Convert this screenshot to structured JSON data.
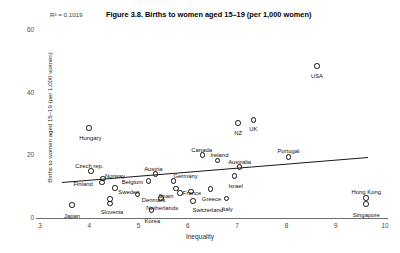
{
  "figure": {
    "r2_label": "R² = 0.1019",
    "title": "Figure 3.8. Births to women aged 15–19 (per 1,000 women)",
    "background_color": "#ffffff",
    "marker_color": "#111111",
    "trend_color": "#1a1a1a",
    "axis_color": "#6e6e6e"
  },
  "chart_data": {
    "type": "scatter",
    "title": "Figure 3.8. Births to women aged 15–19 (per 1,000 women)",
    "annotations": [
      "R² = 0.1019"
    ],
    "xlabel": "Inequality",
    "ylabel": "Births to women aged 15–19 (per 1,000 women)",
    "xlim": [
      3,
      10
    ],
    "ylim": [
      0,
      60
    ],
    "xticks": [
      3,
      4,
      5,
      6,
      7,
      8,
      9,
      10
    ],
    "yticks": [
      0,
      20,
      40,
      60
    ],
    "grid": false,
    "legend": null,
    "trendline": {
      "type": "linear",
      "x_start": 3.45,
      "y_start": 11.5,
      "x_end": 9.65,
      "y_end": 19.5
    },
    "points": [
      {
        "label": "Japan",
        "x": 3.65,
        "y": 4.2,
        "label_dx": 0,
        "label_dy": 11
      },
      {
        "label": "Czech rep.",
        "x": 4.04,
        "y": 15.0,
        "label_dx": -2,
        "label_dy": -5
      },
      {
        "label": "Norway",
        "x": 4.28,
        "y": 12.6,
        "label_dx": 12,
        "label_dy": -3
      },
      {
        "label": "Finland",
        "x": 4.26,
        "y": 11.3,
        "label_dx": -19,
        "label_dy": 1
      },
      {
        "label": "Hungary",
        "x": 4.0,
        "y": 28.8,
        "label_dx": 1,
        "label_dy": 10
      },
      {
        "label": "Sweden",
        "x": 4.52,
        "y": 9.6,
        "label_dx": 14,
        "label_dy": 4
      },
      {
        "label": "Slovenia",
        "x": 4.42,
        "y": 6.0,
        "label_dx": 2,
        "label_dy": 13
      },
      {
        "label": "Slovenia2",
        "x": 4.42,
        "y": 4.6,
        "label_dx": 0,
        "label_dy": 0
      },
      {
        "label": "Denmark",
        "x": 4.98,
        "y": 7.5,
        "label_dx": 16,
        "label_dy": 5
      },
      {
        "label": "Belgium",
        "x": 5.2,
        "y": 11.8,
        "label_dx": -16,
        "label_dy": 1
      },
      {
        "label": "Austria",
        "x": 5.34,
        "y": 14.0,
        "label_dx": -2,
        "label_dy": -5
      },
      {
        "label": "Korea",
        "x": 5.26,
        "y": 2.6,
        "label_dx": 1,
        "label_dy": 11
      },
      {
        "label": "Netherlands",
        "x": 5.46,
        "y": 6.4,
        "label_dx": 1,
        "label_dy": 10
      },
      {
        "label": "Germany",
        "x": 5.71,
        "y": 11.9,
        "label_dx": 12,
        "label_dy": -5
      },
      {
        "label": "France",
        "x": 5.76,
        "y": 9.4,
        "label_dx": 16,
        "label_dy": 4
      },
      {
        "label": "Spain",
        "x": 5.84,
        "y": 8.0,
        "label_dx": -14,
        "label_dy": 3
      },
      {
        "label": "Spain2",
        "x": 6.06,
        "y": 8.4,
        "label_dx": 0,
        "label_dy": 0
      },
      {
        "label": "Switzerland",
        "x": 6.1,
        "y": 5.4,
        "label_dx": 15,
        "label_dy": 9
      },
      {
        "label": "Canada",
        "x": 6.3,
        "y": 20.2,
        "label_dx": -1,
        "label_dy": -5
      },
      {
        "label": "Ireland",
        "x": 6.6,
        "y": 18.3,
        "label_dx": 2,
        "label_dy": -6
      },
      {
        "label": "Greece",
        "x": 6.46,
        "y": 9.2,
        "label_dx": 1,
        "label_dy": 10
      },
      {
        "label": "NZ",
        "x": 7.02,
        "y": 30.4,
        "label_dx": 0,
        "label_dy": 10
      },
      {
        "label": "UK",
        "x": 7.33,
        "y": 31.3,
        "label_dx": 0,
        "label_dy": 9
      },
      {
        "label": "Australia",
        "x": 7.05,
        "y": 16.3,
        "label_dx": 0,
        "label_dy": -5
      },
      {
        "label": "Israel",
        "x": 6.95,
        "y": 13.4,
        "label_dx": 1,
        "label_dy": 10
      },
      {
        "label": "Italy",
        "x": 6.78,
        "y": 6.2,
        "label_dx": 1,
        "label_dy": 10
      },
      {
        "label": "Portugal",
        "x": 8.04,
        "y": 19.4,
        "label_dx": 0,
        "label_dy": -6
      },
      {
        "label": "USA",
        "x": 8.62,
        "y": 48.6,
        "label_dx": 0,
        "label_dy": 10
      },
      {
        "label": "Hong Kong",
        "x": 9.62,
        "y": 6.4,
        "label_dx": 0,
        "label_dy": -6
      },
      {
        "label": "Singapore",
        "x": 9.62,
        "y": 4.4,
        "label_dx": 0,
        "label_dy": 11
      }
    ]
  }
}
